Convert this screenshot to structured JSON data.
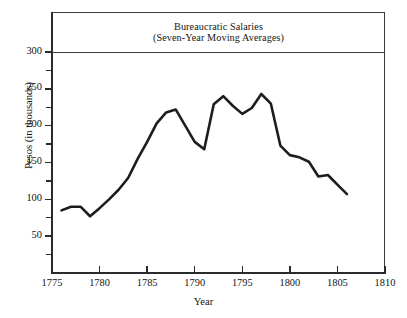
{
  "chart_data": {
    "type": "line",
    "title": "Bureaucratic Salaries",
    "subtitle": "(Seven-Year Moving Averages)",
    "xlabel": "Year",
    "ylabel": "Pesos (in thousands)",
    "xlim": [
      1775,
      1810
    ],
    "ylim": [
      0,
      310
    ],
    "xticks": [
      1775,
      1780,
      1785,
      1790,
      1795,
      1800,
      1805,
      1810
    ],
    "xtick_labels": [
      "1775",
      "1780",
      "1785",
      "1790",
      "1795",
      "1800",
      "1805",
      "1810"
    ],
    "yticks": [
      50,
      100,
      150,
      200,
      250,
      300
    ],
    "ytick_labels": [
      "50",
      "100",
      "150",
      "200",
      "250",
      "300"
    ],
    "yticks_minor": [
      25,
      75,
      125,
      175,
      225,
      275
    ],
    "grid": false,
    "legend": null,
    "line_color": "#1d1d1d",
    "line_width": 2.6,
    "x": [
      1776,
      1777,
      1778,
      1779,
      1780,
      1781,
      1782,
      1783,
      1784,
      1785,
      1786,
      1787,
      1788,
      1789,
      1790,
      1791,
      1792,
      1793,
      1794,
      1795,
      1796,
      1797,
      1798,
      1799,
      1800,
      1801,
      1802,
      1803,
      1804,
      1805,
      1806
    ],
    "values": [
      85,
      90,
      90,
      77,
      88,
      100,
      113,
      129,
      155,
      178,
      203,
      218,
      222,
      200,
      178,
      168,
      229,
      240,
      227,
      216,
      224,
      243,
      230,
      173,
      160,
      157,
      151,
      131,
      133,
      120,
      107
    ],
    "series": [
      {
        "name": "Bureaucratic Salaries (seven-year moving average)",
        "values": [
          85,
          90,
          90,
          77,
          88,
          100,
          113,
          129,
          155,
          178,
          203,
          218,
          222,
          200,
          178,
          168,
          229,
          240,
          227,
          216,
          224,
          243,
          230,
          173,
          160,
          157,
          151,
          131,
          133,
          120,
          107
        ]
      }
    ]
  },
  "axis": {
    "y_label": "Pesos (in thousands)",
    "x_label": "Year"
  },
  "title": {
    "line1": "Bureaucratic Salaries",
    "line2": "(Seven-Year Moving Averages)"
  }
}
